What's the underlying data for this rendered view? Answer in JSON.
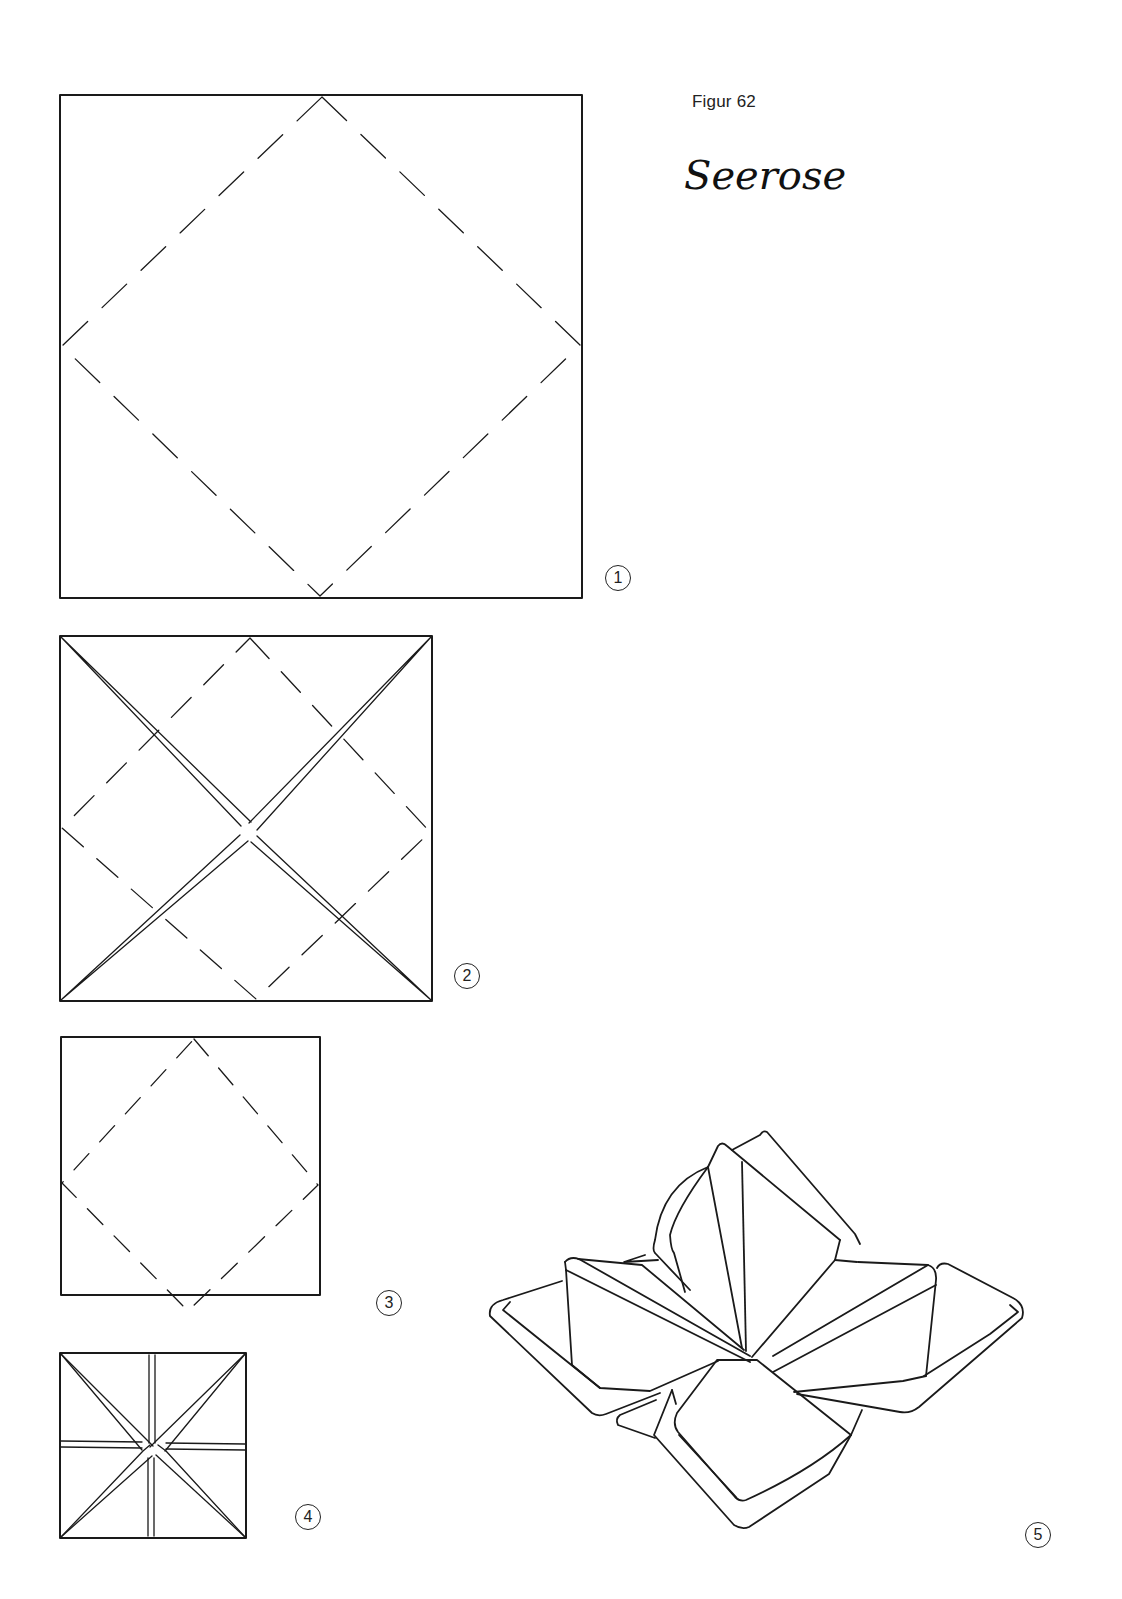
{
  "header": {
    "figure_label": "Figur 62",
    "title": "Seerose"
  },
  "steps": [
    {
      "number": "1",
      "description": "Square with dashed diamond fold lines connecting edge midpoints"
    },
    {
      "number": "2",
      "description": "Square with corners folded to center (solid diagonals) and dashed diamond fold lines"
    },
    {
      "number": "3",
      "description": "Smaller square with dashed diamond fold lines"
    },
    {
      "number": "4",
      "description": "Small square with diagonal and cross folds meeting in center"
    },
    {
      "number": "5",
      "description": "Finished water lily (Seerose) napkin fold"
    }
  ],
  "colors": {
    "line": "#1a1a1a",
    "background": "#ffffff"
  }
}
